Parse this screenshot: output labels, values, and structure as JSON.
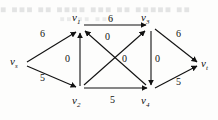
{
  "figure": {
    "background_bleed_text": "■ ■■■ ■■ ■■■■ ■■■ ■■ ■■■■■ ■■",
    "background_bleed_text2": "■■  ■■  ■■■",
    "ink_color": "#111111",
    "paper_color": "#fdfdfc"
  },
  "graph": {
    "type": "directed-flow-network",
    "nodes": [
      {
        "id": "vs",
        "label": "v",
        "sub": "s",
        "x": 16,
        "y": 62
      },
      {
        "id": "v1",
        "label": "v",
        "sub": "1",
        "x": 79,
        "y": 24
      },
      {
        "id": "v3",
        "label": "v",
        "sub": "3",
        "x": 147,
        "y": 24
      },
      {
        "id": "v2",
        "label": "v",
        "sub": "2",
        "x": 79,
        "y": 94
      },
      {
        "id": "v4",
        "label": "v",
        "sub": "4",
        "x": 147,
        "y": 94
      },
      {
        "id": "vt",
        "label": "v",
        "sub": "t",
        "x": 203,
        "y": 64
      }
    ],
    "edges": [
      {
        "from": "vs",
        "to": "v1",
        "label": "6",
        "label_x": 44,
        "label_y": 33
      },
      {
        "from": "vs",
        "to": "v2",
        "label": "5",
        "label_x": 44,
        "label_y": 77
      },
      {
        "from": "v1",
        "to": "v3",
        "label": "6",
        "label_x": 110,
        "label_y": 19
      },
      {
        "from": "v2",
        "to": "v1",
        "label": "0",
        "label_x": 68,
        "label_y": 57
      },
      {
        "from": "v3",
        "to": "v4",
        "label": "0",
        "label_x": 156,
        "label_y": 57
      },
      {
        "from": "v2",
        "to": "v3",
        "label": "0",
        "label_x": 115,
        "label_y": 37
      },
      {
        "from": "v4",
        "to": "v1",
        "label": "0",
        "label_x": 121,
        "label_y": 57
      },
      {
        "from": "v2",
        "to": "v4",
        "label": "5",
        "label_x": 113,
        "label_y": 98
      },
      {
        "from": "v3",
        "to": "vt",
        "label": "6",
        "label_x": 178,
        "label_y": 35
      },
      {
        "from": "v4",
        "to": "vt",
        "label": "5",
        "label_x": 178,
        "label_y": 82
      }
    ]
  }
}
